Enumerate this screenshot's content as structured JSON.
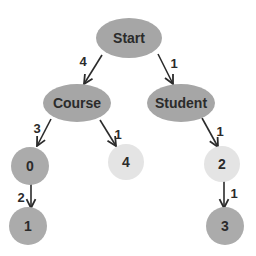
{
  "diagram": {
    "type": "tree",
    "nodes": {
      "start": {
        "label": "Start",
        "color": "#a6a6a6"
      },
      "course": {
        "label": "Course",
        "color": "#a6a6a6"
      },
      "student": {
        "label": "Student",
        "color": "#a6a6a6"
      },
      "n0": {
        "label": "0",
        "color": "#ababab"
      },
      "n4": {
        "label": "4",
        "color": "#e4e4e4"
      },
      "n2": {
        "label": "2",
        "color": "#e4e4e4"
      },
      "n1": {
        "label": "1",
        "color": "#ababab"
      },
      "n3": {
        "label": "3",
        "color": "#ababab"
      }
    },
    "edges": {
      "start_course": {
        "from": "Start",
        "to": "Course",
        "weight": "4"
      },
      "start_student": {
        "from": "Start",
        "to": "Student",
        "weight": "1"
      },
      "course_0": {
        "from": "Course",
        "to": "0",
        "weight": "3"
      },
      "course_4": {
        "from": "Course",
        "to": "4",
        "weight": "1"
      },
      "student_2": {
        "from": "Student",
        "to": "2",
        "weight": "1"
      },
      "n0_1": {
        "from": "0",
        "to": "1",
        "weight": "2"
      },
      "n2_3": {
        "from": "2",
        "to": "3",
        "weight": "1"
      }
    }
  }
}
